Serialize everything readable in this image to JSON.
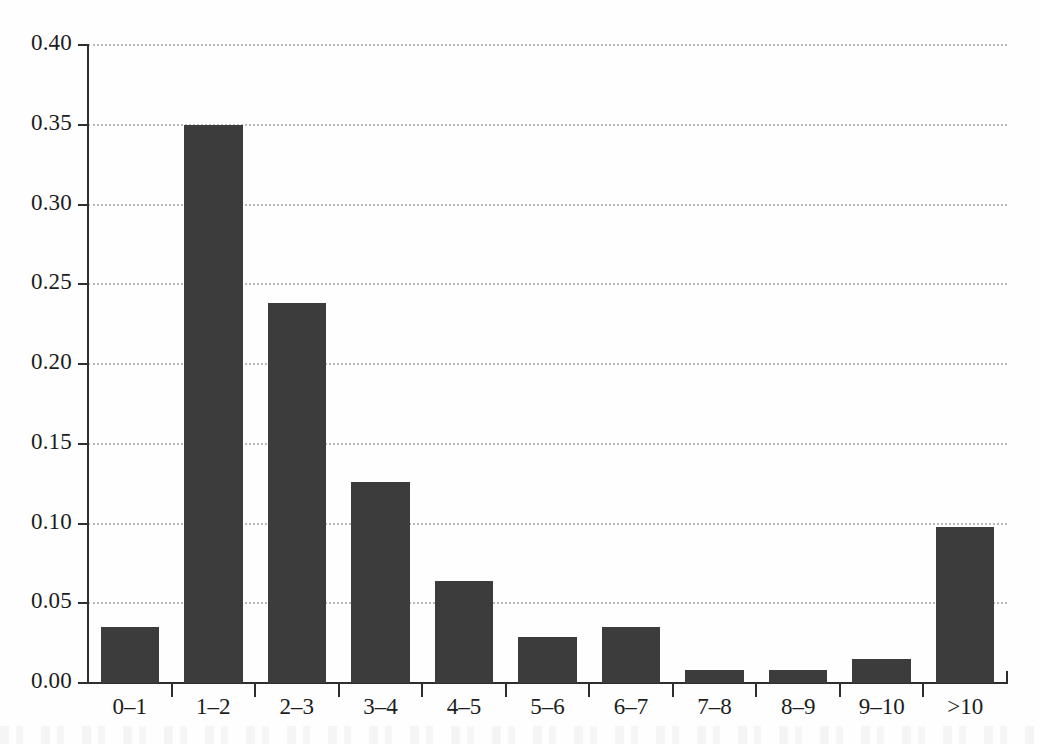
{
  "chart_data": {
    "type": "bar",
    "title": "",
    "subtitle": "",
    "xlabel": "",
    "ylabel": "",
    "categories": [
      "0–1",
      "1–2",
      "2–3",
      "3–4",
      "4–5",
      "5–6",
      "6–7",
      "7–8",
      "8–9",
      "9–10",
      ">10"
    ],
    "values": [
      0.035,
      0.35,
      0.238,
      0.126,
      0.064,
      0.029,
      0.035,
      0.008,
      0.008,
      0.015,
      0.098
    ],
    "ylim": [
      0.0,
      0.4
    ],
    "ytick_values": [
      0.0,
      0.05,
      0.1,
      0.15,
      0.2,
      0.25,
      0.3,
      0.35,
      0.4
    ],
    "ytick_labels": [
      "0.00",
      "0.05",
      "0.10",
      "0.15",
      "0.20",
      "0.25",
      "0.30",
      "0.35",
      "0.40"
    ],
    "grid": "horizontal-dotted",
    "legend": null,
    "bar_color": "#3c3c3c",
    "grid_color": "#b9b9b9",
    "axis_color": "#2e2e2e",
    "background_color": "#fefefe"
  }
}
